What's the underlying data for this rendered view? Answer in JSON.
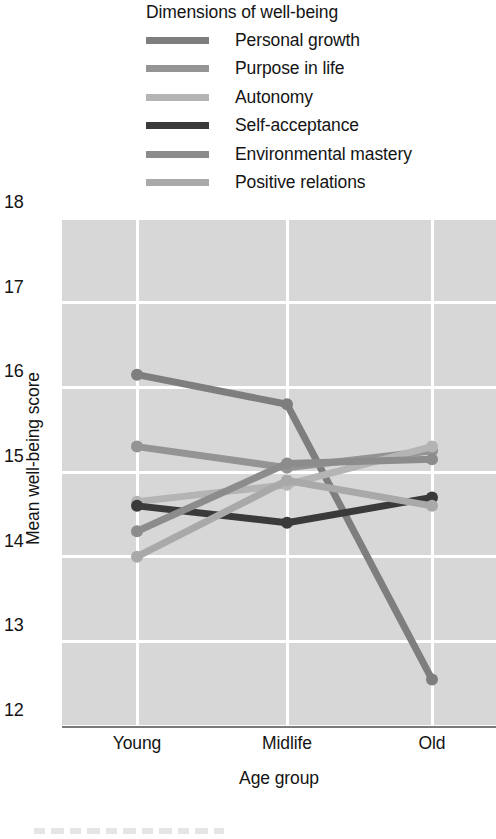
{
  "legend": {
    "title": "Dimensions of well-being",
    "items": [
      {
        "label": "Personal growth",
        "color": "#7e7e7e"
      },
      {
        "label": "Purpose in life",
        "color": "#949494"
      },
      {
        "label": "Autonomy",
        "color": "#b4b4b4"
      },
      {
        "label": "Self-acceptance",
        "color": "#3a3a3a"
      },
      {
        "label": "Environmental mastery",
        "color": "#8c8c8c"
      },
      {
        "label": "Positive relations",
        "color": "#a9a9a9"
      }
    ]
  },
  "chart_data": {
    "type": "line",
    "title": "",
    "xlabel": "Age group",
    "ylabel": "Mean well-being score",
    "categories": [
      "Young",
      "Midlife",
      "Old"
    ],
    "ylim": [
      12,
      18
    ],
    "yticks": [
      18,
      17,
      16,
      15,
      14,
      13,
      12
    ],
    "grid": true,
    "legend_position": "top",
    "plot_background": "#d7d7d7",
    "gridline_color": "#ffffff",
    "series": [
      {
        "name": "Personal growth",
        "color": "#7e7e7e",
        "values": [
          16.15,
          15.8,
          12.55
        ]
      },
      {
        "name": "Purpose in life",
        "color": "#949494",
        "values": [
          15.3,
          15.05,
          15.25
        ]
      },
      {
        "name": "Autonomy",
        "color": "#b4b4b4",
        "values": [
          14.65,
          14.85,
          15.3
        ]
      },
      {
        "name": "Self-acceptance",
        "color": "#3a3a3a",
        "values": [
          14.6,
          14.4,
          14.7
        ]
      },
      {
        "name": "Environmental mastery",
        "color": "#8c8c8c",
        "values": [
          14.3,
          15.1,
          15.15
        ]
      },
      {
        "name": "Positive relations",
        "color": "#a9a9a9",
        "values": [
          14.0,
          14.9,
          14.6
        ]
      }
    ]
  }
}
